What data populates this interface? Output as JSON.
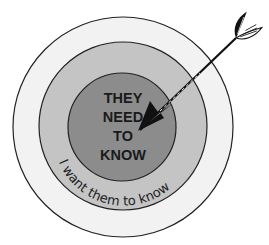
{
  "diagram": {
    "type": "target",
    "rings": [
      {
        "name": "outer",
        "fill": "#f2f2f2",
        "stroke": "#222222"
      },
      {
        "name": "middle",
        "label": "I want them to know",
        "fill": "#c4c4c4",
        "stroke": "#222222"
      },
      {
        "name": "inner",
        "label_lines": [
          "THEY",
          "NEED",
          "TO",
          "KNOW"
        ],
        "fill": "#8c8c8c",
        "stroke": "#222222"
      }
    ],
    "center_label": {
      "line1": "THEY",
      "line2": "NEED",
      "line3": "TO",
      "line4": "KNOW"
    },
    "ring_label": "I want them to know",
    "arrow": {
      "direction": "from top-right into center"
    }
  }
}
